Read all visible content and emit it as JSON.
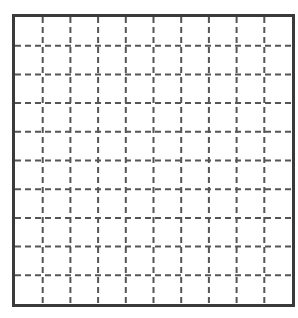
{
  "grid": {
    "columns": 10,
    "rows": 10,
    "border_color": "#3a3a3a",
    "line_color": "#555555",
    "dash_pattern": "6 4"
  }
}
